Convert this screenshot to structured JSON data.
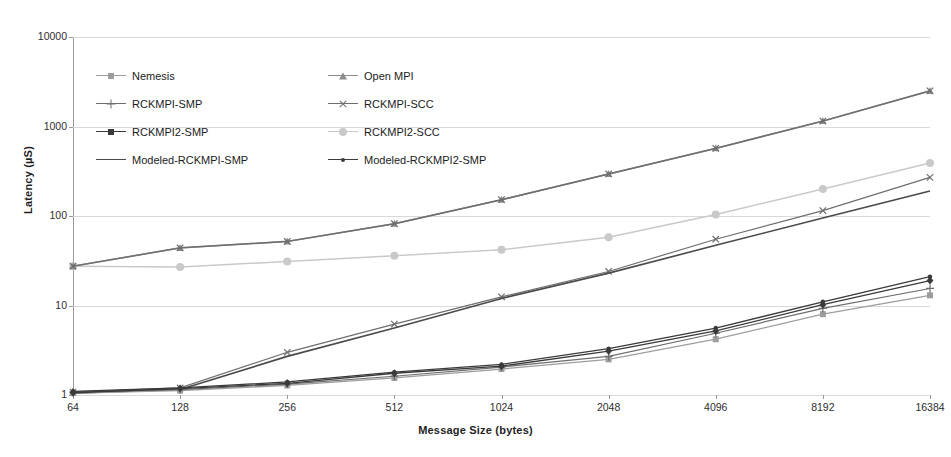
{
  "chart_data": {
    "type": "line",
    "title": "",
    "xlabel": "Message Size (bytes)",
    "ylabel": "Latency (µS)",
    "x_scale": "log2",
    "y_scale": "log10",
    "grid": true,
    "legend_position": "inside-top-left",
    "categories": [
      "64",
      "128",
      "256",
      "512",
      "1024",
      "2048",
      "4096",
      "8192",
      "16384"
    ],
    "x": [
      64,
      128,
      256,
      512,
      1024,
      2048,
      4096,
      8192,
      16384
    ],
    "xlim": [
      64,
      16384
    ],
    "ylim": [
      1,
      10000
    ],
    "ytick_labels": [
      "1",
      "10",
      "100",
      "1000",
      "10000"
    ],
    "yticks": [
      1,
      10,
      100,
      1000,
      10000
    ],
    "series": [
      {
        "name": "Nemesis",
        "marker": "square",
        "color": "#9d9d9d",
        "values": [
          1.05,
          1.12,
          1.28,
          1.55,
          1.95,
          2.5,
          4.2,
          8.0,
          13.0
        ]
      },
      {
        "name": "Open MPI",
        "marker": "triangle",
        "color": "#8d8d8d",
        "values": [
          27.5,
          44.0,
          52.0,
          82.0,
          152.0,
          295.0,
          570.0,
          1150.0,
          2500.0
        ]
      },
      {
        "name": "RCKMPI-SMP",
        "marker": "cross",
        "color": "#6e6e6e",
        "values": [
          1.08,
          1.15,
          1.32,
          1.62,
          2.05,
          2.7,
          4.9,
          9.3,
          15.5
        ]
      },
      {
        "name": "RCKMPI-SCC",
        "marker": "xmark",
        "color": "#6e6e6e",
        "values": [
          27.5,
          44.0,
          52.0,
          82.0,
          152.0,
          295.0,
          570.0,
          1150.0,
          2500.0
        ]
      },
      {
        "name": "RCKMPI2-SMP",
        "marker": "diamond",
        "color": "#3a3a3a",
        "values": [
          1.06,
          1.18,
          1.35,
          1.75,
          2.1,
          3.1,
          5.2,
          10.2,
          19.0
        ]
      },
      {
        "name": "RCKMPI2-SCC",
        "marker": "circle",
        "color": "#c9c9c9",
        "values": [
          27.5,
          27.0,
          31.0,
          36.0,
          42.0,
          58.0,
          104.0,
          200.0,
          390.0
        ]
      },
      {
        "name": "Modeled-RCKMPI-SMP",
        "marker": "none",
        "color": "#4a4a4a",
        "values": [
          1.05,
          1.15,
          2.7,
          5.6,
          12.0,
          23.0,
          47.0,
          95.0,
          190.0
        ]
      },
      {
        "name": "Modeled-RCKMPI2-SMP",
        "marker": "dot",
        "color": "#3a3a3a",
        "values": [
          1.1,
          1.2,
          1.4,
          1.8,
          2.2,
          3.3,
          5.6,
          11.0,
          21.0
        ]
      }
    ],
    "notes": {
      "overlapping": "Open MPI and RCKMPI-SCC traces coincide on the upper curve; the modeled RCKMPI-SMP line rises steeply from 128 bytes.",
      "secondary_upper": {
        "name": "RCKMPI-SCC-upper-x",
        "values": [
          1.08,
          1.2,
          3.0,
          6.2,
          12.5,
          24.0,
          55.0,
          115.0,
          270.0
        ]
      }
    }
  }
}
